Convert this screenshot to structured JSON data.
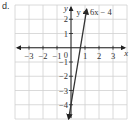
{
  "problem_label": "d.",
  "chart_data": {
    "type": "line",
    "title": "",
    "equation_label": "y = 6x − 4",
    "xlabel": "x",
    "ylabel": "y",
    "xlim": [
      -4,
      4
    ],
    "ylim": [
      -5,
      3
    ],
    "x_ticks": [
      "-3",
      "-2",
      "-1",
      "1",
      "2",
      "3"
    ],
    "y_ticks": [
      "2",
      "1",
      "-1",
      "-2",
      "-3",
      "-4"
    ],
    "origin_label": "0",
    "grid": true,
    "series": [
      {
        "name": "y = 6x − 4",
        "slope": 6,
        "intercept": -4,
        "x": [
          -0.17,
          1.12
        ],
        "y": [
          -5,
          2.7
        ]
      }
    ],
    "colors": {
      "line": "#333333",
      "grid": "#d0d0d0",
      "axis": "#222222"
    }
  }
}
